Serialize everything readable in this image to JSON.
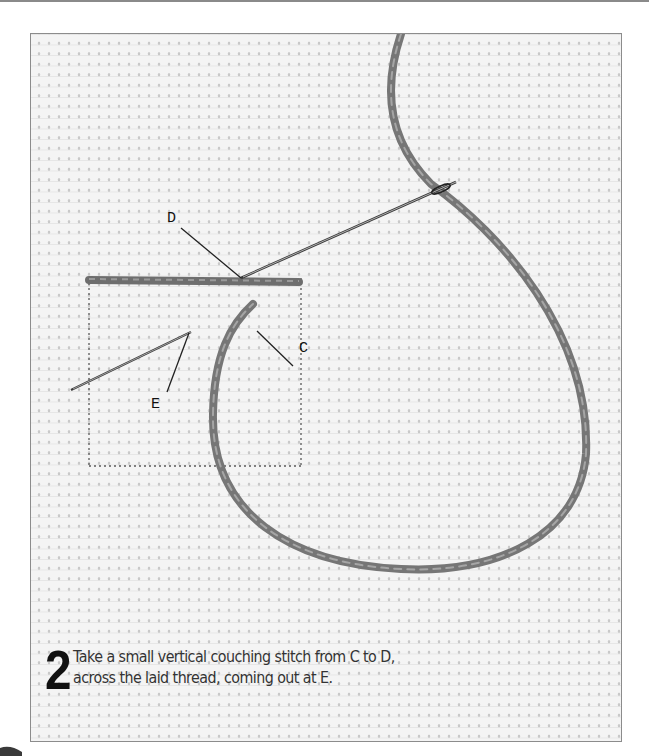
{
  "figure": {
    "step_number": "2",
    "caption_line1": "Take a small vertical couching stitch from C to D,",
    "caption_line2": "across the laid thread, coming out at E.",
    "labels": {
      "d": "D",
      "c": "C",
      "e": "E"
    },
    "colors": {
      "thread": "#7d7d7d",
      "fabric": "#f4f4f4",
      "frame": "#8c8c8c",
      "text": "#333333"
    }
  }
}
